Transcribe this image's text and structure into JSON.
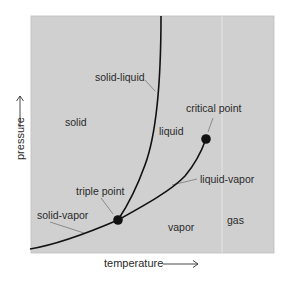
{
  "diagram": {
    "type": "phase-diagram",
    "colors": {
      "background": "#ffffff",
      "plot_fill": "#d0d0d0",
      "plot_border": "#bdbdbd",
      "curve": "#111111",
      "leader": "#777777",
      "text": "#2a2a2a",
      "divider": "#e4e4e4"
    },
    "axes": {
      "x_label": "temperature",
      "y_label": "pressure"
    },
    "regions": {
      "solid": "solid",
      "liquid": "liquid",
      "vapor": "vapor",
      "gas": "gas"
    },
    "curves": {
      "solid_liquid": "solid-liquid",
      "liquid_vapor": "liquid-vapor",
      "solid_vapor": "solid-vapor"
    },
    "points": {
      "triple": "triple point",
      "critical": "critical point"
    }
  }
}
